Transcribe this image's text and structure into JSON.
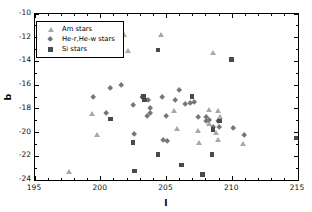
{
  "chart_data": {
    "type": "scatter",
    "title": "",
    "xlabel": "l",
    "ylabel": "b",
    "xlim": [
      195,
      215
    ],
    "ylim": [
      -24,
      -10
    ],
    "x_major_ticks": [
      195,
      200,
      205,
      210,
      215
    ],
    "x_minor_step": 1,
    "y_major_ticks": [
      -10,
      -12,
      -14,
      -16,
      -18,
      -20,
      -22,
      -24
    ],
    "y_minor_step": 1,
    "grid": false,
    "legend_position": "upper-left",
    "axis_color": "#000000",
    "series": [
      {
        "name": "Am stars",
        "marker": "triangle",
        "color": "#a8a8a8",
        "points": [
          [
            201.8,
            -11.8
          ],
          [
            204.6,
            -11.8
          ],
          [
            202.1,
            -13.1
          ],
          [
            208.5,
            -13.3
          ],
          [
            205.6,
            -18.2
          ],
          [
            199.3,
            -18.4
          ],
          [
            199.7,
            -20.2
          ],
          [
            197.6,
            -23.3
          ],
          [
            208.2,
            -18.1
          ],
          [
            208.9,
            -18.2
          ],
          [
            209.1,
            -18.7
          ],
          [
            208.2,
            -19.3
          ],
          [
            207.4,
            -19.9
          ],
          [
            208.8,
            -20.0
          ],
          [
            205.8,
            -19.7
          ],
          [
            208.9,
            -20.6
          ],
          [
            210.8,
            -21.0
          ],
          [
            207.5,
            -20.9
          ]
        ]
      },
      {
        "name": "He-r,He-w stars",
        "marker": "diamond",
        "color": "#767676",
        "points": [
          [
            199.5,
            -17.1
          ],
          [
            200.8,
            -16.3
          ],
          [
            201.6,
            -16.1
          ],
          [
            206.0,
            -16.5
          ],
          [
            200.5,
            -18.4
          ],
          [
            203.2,
            -17.1
          ],
          [
            203.7,
            -17.3
          ],
          [
            204.7,
            -17.1
          ],
          [
            205.7,
            -17.3
          ],
          [
            206.5,
            -17.7
          ],
          [
            206.9,
            -17.6
          ],
          [
            207.2,
            -17.5
          ],
          [
            202.5,
            -17.8
          ],
          [
            203.8,
            -18.0
          ],
          [
            203.8,
            -18.4
          ],
          [
            203.6,
            -18.7
          ],
          [
            205.0,
            -18.7
          ],
          [
            202.6,
            -20.2
          ],
          [
            204.8,
            -20.7
          ],
          [
            205.1,
            -20.8
          ],
          [
            207.5,
            -18.8
          ],
          [
            208.1,
            -18.8
          ],
          [
            208.3,
            -19.0
          ],
          [
            208.1,
            -19.1
          ],
          [
            209.0,
            -19.1
          ],
          [
            208.6,
            -19.6
          ],
          [
            209.1,
            -19.6
          ],
          [
            210.1,
            -19.7
          ],
          [
            211.0,
            -20.3
          ]
        ]
      },
      {
        "name": "Si stars",
        "marker": "square",
        "color": "#4a4a4a",
        "points": [
          [
            204.4,
            -13.1
          ],
          [
            210.0,
            -13.9
          ],
          [
            203.3,
            -17.0
          ],
          [
            203.4,
            -17.3
          ],
          [
            207.0,
            -17.0
          ],
          [
            200.8,
            -18.9
          ],
          [
            209.1,
            -19.1
          ],
          [
            208.6,
            -19.8
          ],
          [
            202.5,
            -20.9
          ],
          [
            204.4,
            -21.9
          ],
          [
            208.5,
            -21.9
          ],
          [
            206.2,
            -22.8
          ],
          [
            202.6,
            -23.3
          ],
          [
            207.8,
            -23.6
          ],
          [
            214.9,
            -20.5
          ]
        ]
      }
    ]
  }
}
